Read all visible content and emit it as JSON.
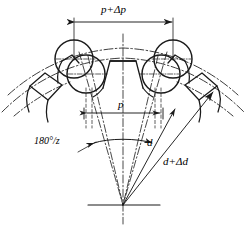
{
  "diagram": {
    "background_color": "#ffffff",
    "line_color": "#1a1a1a",
    "labels": {
      "pitch_upper": "p+Δp",
      "pitch_lower": "p",
      "angle": "180°/z",
      "diameter": "d",
      "diameter_delta": "d+Δd"
    },
    "annotations": {
      "tooth_count_symbol": "z",
      "delta_symbol": "Δ",
      "degree_symbol": "°"
    },
    "geometry": {
      "center_x": 123,
      "center_y": 205,
      "half_angle_deg": 13,
      "pin_circle_radius": 14.5,
      "pitch_radius_inner": 118,
      "pitch_radius_outer": 140
    }
  }
}
